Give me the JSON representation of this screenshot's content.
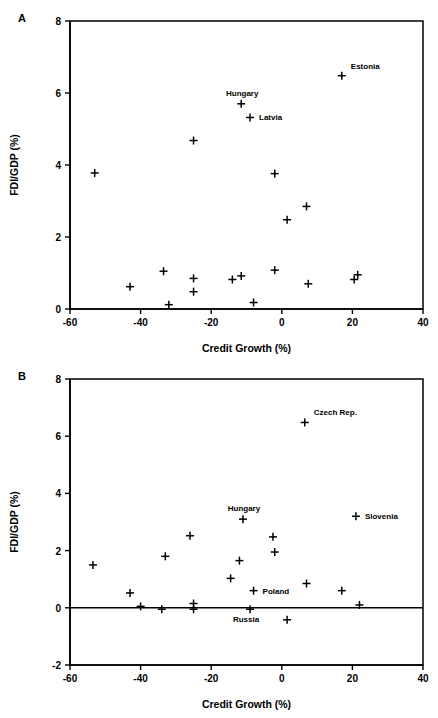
{
  "figure": {
    "panel_a_letter": "A",
    "panel_b_letter": "B"
  },
  "chart_data": [
    {
      "type": "scatter",
      "panel": "A",
      "title": "",
      "xlabel": "Credit Growth (%)",
      "ylabel": "FDI/GDP (%)",
      "xlim": [
        -60,
        40
      ],
      "ylim": [
        0,
        8
      ],
      "xticks": [
        -60,
        -40,
        -20,
        0,
        20,
        40
      ],
      "yticks": [
        0,
        2,
        4,
        6,
        8
      ],
      "xticklabels": [
        "-60",
        "-40",
        "-20",
        "0",
        "20",
        "40"
      ],
      "yticklabels": [
        "0",
        "2",
        "4",
        "6",
        "8"
      ],
      "grid": false,
      "legend": "none",
      "marker": "plus",
      "points": [
        {
          "x": -53.0,
          "y": 3.78,
          "label": ""
        },
        {
          "x": -43.0,
          "y": 0.62,
          "label": ""
        },
        {
          "x": -33.5,
          "y": 1.05,
          "label": ""
        },
        {
          "x": -32.0,
          "y": 0.12,
          "label": ""
        },
        {
          "x": -25.0,
          "y": 4.68,
          "label": ""
        },
        {
          "x": -25.0,
          "y": 0.85,
          "label": ""
        },
        {
          "x": -25.0,
          "y": 0.48,
          "label": ""
        },
        {
          "x": -14.0,
          "y": 0.82,
          "label": ""
        },
        {
          "x": -11.5,
          "y": 5.7,
          "label": "Hungary",
          "label_pos": "above"
        },
        {
          "x": -11.5,
          "y": 0.92,
          "label": ""
        },
        {
          "x": -9.0,
          "y": 5.32,
          "label": "Latvia",
          "label_pos": "right"
        },
        {
          "x": -8.0,
          "y": 0.18,
          "label": ""
        },
        {
          "x": -2.0,
          "y": 3.76,
          "label": ""
        },
        {
          "x": -2.0,
          "y": 1.08,
          "label": ""
        },
        {
          "x": 1.5,
          "y": 2.48,
          "label": ""
        },
        {
          "x": 7.0,
          "y": 2.85,
          "label": ""
        },
        {
          "x": 7.5,
          "y": 0.7,
          "label": ""
        },
        {
          "x": 17.0,
          "y": 6.48,
          "label": "Estonia",
          "label_pos": "above-right"
        },
        {
          "x": 20.5,
          "y": 0.82,
          "label": ""
        },
        {
          "x": 21.5,
          "y": 0.95,
          "label": ""
        }
      ]
    },
    {
      "type": "scatter",
      "panel": "B",
      "title": "",
      "xlabel": "Credit Growth (%)",
      "ylabel": "FDI/GDP (%)",
      "xlim": [
        -60,
        40
      ],
      "ylim": [
        -2,
        8
      ],
      "xticks": [
        -60,
        -40,
        -20,
        0,
        20,
        40
      ],
      "yticks": [
        -2,
        0,
        2,
        4,
        6,
        8
      ],
      "xticklabels": [
        "-60",
        "-40",
        "-20",
        "0",
        "20",
        "40"
      ],
      "yticklabels": [
        "-2",
        "0",
        "2",
        "4",
        "6",
        "8"
      ],
      "grid": false,
      "zeroline": true,
      "legend": "none",
      "marker": "plus",
      "points": [
        {
          "x": -53.5,
          "y": 1.5,
          "label": ""
        },
        {
          "x": -43.0,
          "y": 0.52,
          "label": ""
        },
        {
          "x": -40.0,
          "y": 0.05,
          "label": ""
        },
        {
          "x": -34.0,
          "y": -0.05,
          "label": ""
        },
        {
          "x": -33.0,
          "y": 1.8,
          "label": ""
        },
        {
          "x": -26.0,
          "y": 2.52,
          "label": ""
        },
        {
          "x": -25.0,
          "y": 0.15,
          "label": ""
        },
        {
          "x": -25.0,
          "y": -0.05,
          "label": ""
        },
        {
          "x": -14.5,
          "y": 1.03,
          "label": ""
        },
        {
          "x": -12.0,
          "y": 1.65,
          "label": ""
        },
        {
          "x": -11.0,
          "y": 3.1,
          "label": "Hungary",
          "label_pos": "above"
        },
        {
          "x": -8.0,
          "y": 0.6,
          "label": "Poland",
          "label_pos": "right"
        },
        {
          "x": -9.0,
          "y": -0.05,
          "label": "Russia",
          "label_pos": "below-left"
        },
        {
          "x": -2.5,
          "y": 2.48,
          "label": ""
        },
        {
          "x": -2.0,
          "y": 1.95,
          "label": ""
        },
        {
          "x": 1.5,
          "y": -0.42,
          "label": ""
        },
        {
          "x": 6.5,
          "y": 6.48,
          "label": "Czech Rep.",
          "label_pos": "above-right"
        },
        {
          "x": 7.0,
          "y": 0.85,
          "label": ""
        },
        {
          "x": 17.0,
          "y": 0.6,
          "label": ""
        },
        {
          "x": 21.0,
          "y": 3.2,
          "label": "Slovenia",
          "label_pos": "right"
        },
        {
          "x": 22.0,
          "y": 0.1,
          "label": ""
        }
      ]
    }
  ]
}
